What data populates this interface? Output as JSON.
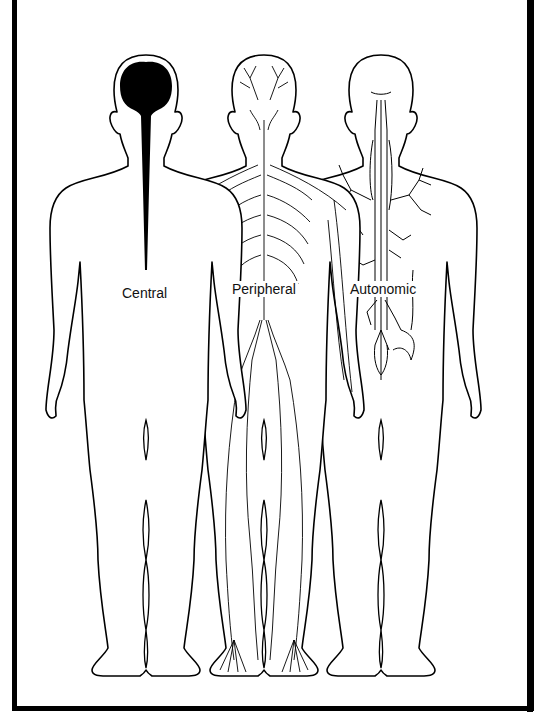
{
  "diagram": {
    "figures": [
      {
        "id": "central",
        "label": "Central",
        "description": "Brain and spinal cord filled in black"
      },
      {
        "id": "peripheral",
        "label": "Peripheral",
        "description": "Spinal nerves, intercostal nerves and limb nerves"
      },
      {
        "id": "autonomic",
        "label": "Autonomic",
        "description": "Sympathetic chain with branching visceral plexuses"
      }
    ],
    "colors": {
      "ink": "#000000",
      "background": "#ffffff",
      "frame": "#000000"
    }
  }
}
